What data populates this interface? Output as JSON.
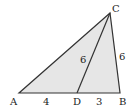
{
  "diagram": {
    "type": "geometry-triangle",
    "points": {
      "A": {
        "label": "A",
        "x": 19,
        "y": 93
      },
      "B": {
        "label": "B",
        "x": 120,
        "y": 93
      },
      "C": {
        "label": "C",
        "x": 110,
        "y": 13
      },
      "D": {
        "label": "D",
        "x": 77,
        "y": 93
      }
    },
    "segments": {
      "AD": {
        "label": "4"
      },
      "DB": {
        "label": "3"
      },
      "CD": {
        "label": "6"
      },
      "CB": {
        "label": "6"
      }
    },
    "colors": {
      "fill": "#e6e6e6",
      "stroke": "#333333"
    }
  }
}
